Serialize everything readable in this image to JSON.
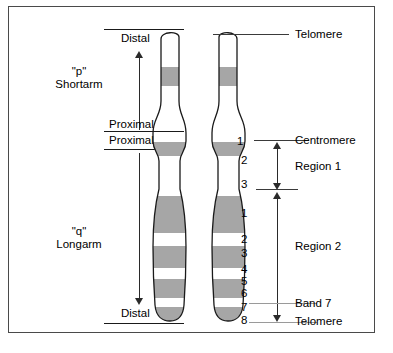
{
  "figure": {
    "type": "diagram"
  },
  "arms": {
    "short": {
      "symbol": "\"p\"",
      "name": "Shortarm"
    },
    "long": {
      "symbol": "\"q\"",
      "name": "Longarm"
    }
  },
  "orientation_labels": {
    "p_distal": "Distal",
    "p_proximal": "Proximal",
    "q_proximal": "Proximal",
    "q_distal": "Distal"
  },
  "callouts": {
    "telomere_top": "Telomere",
    "centromere": "Centromere",
    "band7": "Band 7",
    "telomere_bottom": "Telomere"
  },
  "regions": [
    {
      "label": "Region 1",
      "bands": [
        "1",
        "2",
        "3"
      ]
    },
    {
      "label": "Region 2",
      "bands": [
        "1",
        "2",
        "3",
        "4",
        "5",
        "6",
        "7",
        "8"
      ]
    }
  ],
  "band_numbers": [
    {
      "id": "r1b1",
      "text": "1",
      "top": 128
    },
    {
      "id": "r1b2",
      "text": "2",
      "top": 147
    },
    {
      "id": "r1b3",
      "text": "3",
      "top": 171
    },
    {
      "id": "r2b1",
      "text": "1",
      "top": 200
    },
    {
      "id": "r2b2",
      "text": "2",
      "top": 226
    },
    {
      "id": "r2b3",
      "text": "3",
      "top": 240
    },
    {
      "id": "r2b4",
      "text": "4",
      "top": 256
    },
    {
      "id": "r2b5",
      "text": "5",
      "top": 268
    },
    {
      "id": "r2b6",
      "text": "6",
      "top": 280
    },
    {
      "id": "r2b7",
      "text": "7",
      "top": 294
    },
    {
      "id": "r2b8",
      "text": "8",
      "top": 307
    }
  ],
  "chromosome": {
    "chromatids": 2,
    "short_arm_bands": 1,
    "long_arm_bands": 4,
    "centromere_band": 1
  },
  "colors": {
    "band_gray": "#a6a6a6",
    "outline": "#1a1a1a",
    "frame": "#4a4a4a",
    "text": "#000000"
  }
}
